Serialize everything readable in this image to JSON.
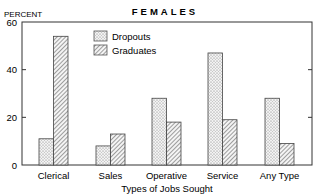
{
  "chart_data": {
    "type": "bar",
    "title": "FEMALES",
    "ylabel": "PERCENT",
    "xlabel": "Types of Jobs Sought",
    "ylim": [
      0,
      60
    ],
    "yticks": [
      0,
      20,
      40,
      60
    ],
    "grid": false,
    "legend_position": "upper-left-inside",
    "categories": [
      "Clerical",
      "Sales",
      "Operative",
      "Service",
      "Any Type"
    ],
    "series": [
      {
        "name": "Dropouts",
        "pattern": "dotted",
        "values": [
          11,
          8,
          28,
          47,
          28
        ]
      },
      {
        "name": "Graduates",
        "pattern": "hatched",
        "values": [
          54,
          13,
          18,
          19,
          9
        ]
      }
    ]
  },
  "colors": {
    "axis": "#333333",
    "bar_outline": "#444444",
    "dots": "#777777",
    "hatch": "#555555",
    "background": "#ffffff"
  }
}
